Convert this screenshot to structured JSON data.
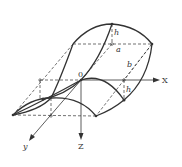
{
  "diagram": {
    "type": "3d-surface",
    "axes": {
      "x": {
        "label": "X"
      },
      "y": {
        "label": "y"
      },
      "z": {
        "label": "Z"
      },
      "origin": {
        "label": "0"
      }
    },
    "dimensions": {
      "h_top": "h",
      "a": "a",
      "b": "b",
      "h_right": "h"
    },
    "colors": {
      "stroke": "#333333",
      "background": "#ffffff"
    }
  }
}
